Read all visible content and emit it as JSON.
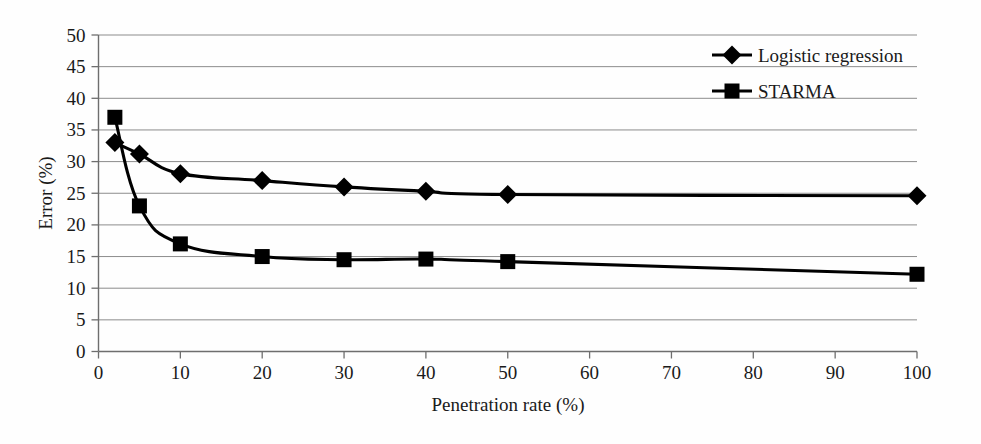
{
  "chart_data": {
    "type": "line",
    "title": "",
    "xlabel": "Penetration rate (%)",
    "ylabel": "Error (%)",
    "xlim": [
      0,
      100
    ],
    "ylim": [
      0,
      50
    ],
    "xticks": [
      "0",
      "10",
      "20",
      "30",
      "40",
      "50",
      "60",
      "70",
      "80",
      "90",
      "100"
    ],
    "yticks": [
      "0",
      "5",
      "10",
      "15",
      "20",
      "25",
      "30",
      "35",
      "40",
      "45",
      "50"
    ],
    "grid": "horizontal",
    "legend_position": "top-right",
    "series": [
      {
        "name": "Logistic regression",
        "marker": "diamond",
        "color": "#000000",
        "x": [
          2,
          5,
          10,
          20,
          30,
          40,
          50,
          100
        ],
        "values": [
          33.0,
          31.2,
          28.1,
          27.0,
          26.0,
          25.3,
          24.8,
          24.6
        ]
      },
      {
        "name": "STARMA",
        "marker": "square",
        "color": "#000000",
        "x": [
          2,
          5,
          10,
          20,
          30,
          40,
          50,
          100
        ],
        "values": [
          37.0,
          23.0,
          17.0,
          15.0,
          14.5,
          14.6,
          14.2,
          12.2
        ]
      }
    ]
  },
  "legend": {
    "items": [
      {
        "label": "Logistic regression",
        "marker": "diamond"
      },
      {
        "label": "STARMA",
        "marker": "square"
      }
    ]
  },
  "axes": {
    "x_title": "Penetration rate (%)",
    "y_title": "Error (%)",
    "x_tick_labels": [
      "0",
      "10",
      "20",
      "30",
      "40",
      "50",
      "60",
      "70",
      "80",
      "90",
      "100"
    ],
    "y_tick_labels": [
      "0",
      "5",
      "10",
      "15",
      "20",
      "25",
      "30",
      "35",
      "40",
      "45",
      "50"
    ]
  }
}
